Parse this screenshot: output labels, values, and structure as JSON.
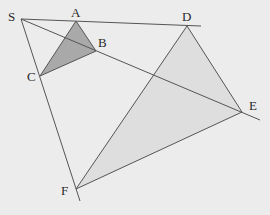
{
  "diagram": {
    "center": {
      "label": "S",
      "x": 21,
      "y": 19
    },
    "small_triangle": {
      "vertices": [
        {
          "label": "A",
          "x": 76,
          "y": 21
        },
        {
          "label": "B",
          "x": 96,
          "y": 51
        },
        {
          "label": "C",
          "x": 40,
          "y": 76
        }
      ],
      "fill": "#a9a9a9"
    },
    "large_triangle": {
      "vertices": [
        {
          "label": "D",
          "x": 187,
          "y": 26
        },
        {
          "label": "E",
          "x": 242,
          "y": 112
        },
        {
          "label": "F",
          "x": 76,
          "y": 189
        }
      ],
      "fill": "#dedede"
    },
    "rays": [
      {
        "from": "S",
        "through": [
          "A",
          "D"
        ],
        "end": {
          "x": 201,
          "y": 26
        }
      },
      {
        "from": "S",
        "through": [
          "B",
          "E"
        ],
        "end": {
          "x": 260,
          "y": 120
        }
      },
      {
        "from": "S",
        "through": [
          "C",
          "F"
        ],
        "end": {
          "x": 80,
          "y": 201
        }
      }
    ],
    "labels": {
      "S": "S",
      "A": "A",
      "B": "B",
      "C": "C",
      "D": "D",
      "E": "E",
      "F": "F"
    },
    "colors": {
      "background": "#ececec",
      "line": "#555555",
      "text": "#2a2a2a"
    }
  }
}
